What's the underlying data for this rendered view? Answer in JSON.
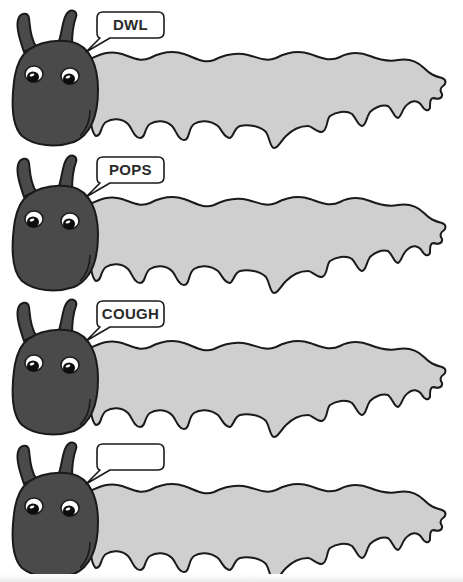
{
  "worksheet": {
    "colors": {
      "head": "#4a4a4a",
      "body": "#cfcfcf",
      "outline": "#1a1a1a",
      "bubble_fill": "#ffffff",
      "text": "#2a2a2a",
      "background": "#ffffff"
    },
    "caterpillars": [
      {
        "bubble_text": "DWL"
      },
      {
        "bubble_text": "POPS"
      },
      {
        "bubble_text": "COUGH"
      },
      {
        "bubble_text": ""
      }
    ]
  }
}
